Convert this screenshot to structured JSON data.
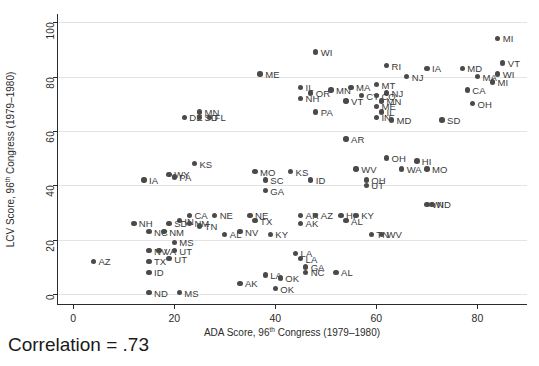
{
  "chart_data": {
    "type": "scatter",
    "title": "",
    "xlabel_parts": {
      "pre": "ADA Score, 96",
      "sup": "th",
      "post": " Congress (1979–1980)"
    },
    "ylabel_parts": {
      "pre": "LCV Score, 96",
      "sup": "th",
      "post": " Congress (1979–1980)"
    },
    "xlabel": "ADA Score, 96th Congress (1979–1980)",
    "ylabel": "LCV Score, 96th Congress (1979–1980)",
    "xlim": [
      -3,
      90
    ],
    "ylim": [
      -4,
      103
    ],
    "xticks": [
      0,
      20,
      40,
      60,
      80
    ],
    "yticks": [
      0,
      20,
      40,
      60,
      80,
      100
    ],
    "grid": "horizontal",
    "legend": "none",
    "annotation": "Correlation = .73",
    "point_color": "#4a4a4a",
    "points": [
      {
        "label": "MI",
        "x": 84.0,
        "y": 94.0,
        "lx": 5
      },
      {
        "label": "WI",
        "x": 48.0,
        "y": 89.0,
        "lx": 5
      },
      {
        "label": "VT",
        "x": 85.0,
        "y": 85.0,
        "lx": 5
      },
      {
        "label": "WI",
        "x": 84.0,
        "y": 81.0,
        "lx": 5
      },
      {
        "label": "RI",
        "x": 62.0,
        "y": 84.0,
        "lx": 5
      },
      {
        "label": "IA",
        "x": 70.0,
        "y": 83.0,
        "lx": 5
      },
      {
        "label": "MD",
        "x": 77.0,
        "y": 83.0,
        "lx": 5
      },
      {
        "label": "NJ",
        "x": 66.0,
        "y": 80.0,
        "lx": 5
      },
      {
        "label": "MA",
        "x": 80.0,
        "y": 80.0,
        "lx": 5
      },
      {
        "label": "MI",
        "x": 83.0,
        "y": 78.0,
        "lx": 5
      },
      {
        "label": "ME",
        "x": 37.0,
        "y": 81.0,
        "lx": 5
      },
      {
        "label": "MT",
        "x": 60.0,
        "y": 77.0,
        "lx": 5
      },
      {
        "label": "NJ",
        "x": 62.0,
        "y": 74.0,
        "lx": 5
      },
      {
        "label": "CA",
        "x": 78.0,
        "y": 75.0,
        "lx": 5
      },
      {
        "label": "IL",
        "x": 45.0,
        "y": 76.0,
        "lx": 5
      },
      {
        "label": "OR",
        "x": 47.0,
        "y": 74.0,
        "lx": 5
      },
      {
        "label": "MN",
        "x": 51.0,
        "y": 75.0,
        "lx": 5
      },
      {
        "label": "MA",
        "x": 55.0,
        "y": 76.0,
        "lx": 5
      },
      {
        "label": "CT",
        "x": 57.0,
        "y": 73.0,
        "lx": 5
      },
      {
        "label": "CO",
        "x": 60.0,
        "y": 73.0,
        "lx": 5
      },
      {
        "label": "NH",
        "x": 45.0,
        "y": 72.0,
        "lx": 5
      },
      {
        "label": "VT",
        "x": 54.0,
        "y": 71.0,
        "lx": 5
      },
      {
        "label": "MN",
        "x": 61.0,
        "y": 71.0,
        "lx": 5
      },
      {
        "label": "ME",
        "x": 60.0,
        "y": 69.0,
        "lx": 5
      },
      {
        "label": "OH",
        "x": 79.0,
        "y": 70.0,
        "lx": 5
      },
      {
        "label": "PA",
        "x": 48.0,
        "y": 67.0,
        "lx": 5
      },
      {
        "label": "IL",
        "x": 61.0,
        "y": 67.0,
        "lx": 5
      },
      {
        "label": "IN",
        "x": 60.0,
        "y": 65.0,
        "lx": 5
      },
      {
        "label": "MD",
        "x": 63.0,
        "y": 64.0,
        "lx": 5
      },
      {
        "label": "SD",
        "x": 73.0,
        "y": 64.0,
        "lx": 5
      },
      {
        "label": "DE",
        "x": 22.0,
        "y": 65.0,
        "lx": 5
      },
      {
        "label": "MN",
        "x": 25.0,
        "y": 67.0,
        "lx": 5
      },
      {
        "label": "SD",
        "x": 25.0,
        "y": 65.0,
        "lx": 5
      },
      {
        "label": "FL",
        "x": 27.0,
        "y": 65.0,
        "lx": 5
      },
      {
        "label": "AR",
        "x": 54.0,
        "y": 57.0,
        "lx": 5
      },
      {
        "label": "OH",
        "x": 62.0,
        "y": 50.0,
        "lx": 5
      },
      {
        "label": "HI",
        "x": 68.0,
        "y": 49.0,
        "lx": 5
      },
      {
        "label": "WA",
        "x": 65.0,
        "y": 46.0,
        "lx": 5
      },
      {
        "label": "MO",
        "x": 70.0,
        "y": 46.0,
        "lx": 5
      },
      {
        "label": "KS",
        "x": 24.0,
        "y": 48.0,
        "lx": 5
      },
      {
        "label": "WY",
        "x": 19.0,
        "y": 44.0,
        "lx": 5
      },
      {
        "label": "PA",
        "x": 20.0,
        "y": 43.0,
        "lx": 5
      },
      {
        "label": "IA",
        "x": 14.0,
        "y": 42.0,
        "lx": 5
      },
      {
        "label": "MO",
        "x": 36.0,
        "y": 45.0,
        "lx": 5
      },
      {
        "label": "KS",
        "x": 43.0,
        "y": 45.0,
        "lx": 5
      },
      {
        "label": "WV",
        "x": 56.0,
        "y": 46.0,
        "lx": 5
      },
      {
        "label": "SC",
        "x": 38.0,
        "y": 42.0,
        "lx": 5
      },
      {
        "label": "ID",
        "x": 47.0,
        "y": 42.0,
        "lx": 5
      },
      {
        "label": "OH",
        "x": 58.0,
        "y": 42.0,
        "lx": 5
      },
      {
        "label": "UT",
        "x": 58.0,
        "y": 40.0,
        "lx": 5
      },
      {
        "label": "GA",
        "x": 38.0,
        "y": 38.0,
        "lx": 5
      },
      {
        "label": "CA",
        "x": 23.0,
        "y": 29.0,
        "lx": 5
      },
      {
        "label": "NE",
        "x": 28.0,
        "y": 29.0,
        "lx": 5
      },
      {
        "label": "NE",
        "x": 35.0,
        "y": 29.0,
        "lx": 5
      },
      {
        "label": "TX",
        "x": 36.0,
        "y": 27.0,
        "lx": 5
      },
      {
        "label": "AR",
        "x": 45.0,
        "y": 29.0,
        "lx": 5
      },
      {
        "label": "AZ",
        "x": 48.0,
        "y": 29.0,
        "lx": 5
      },
      {
        "label": "HI",
        "x": 53.0,
        "y": 29.0,
        "lx": 5
      },
      {
        "label": "KY",
        "x": 56.0,
        "y": 29.0,
        "lx": 5
      },
      {
        "label": "AL",
        "x": 54.0,
        "y": 27.0,
        "lx": 5
      },
      {
        "label": "IN",
        "x": 21.0,
        "y": 27.0,
        "lx": 5
      },
      {
        "label": "NH",
        "x": 12.0,
        "y": 26.0,
        "lx": 5
      },
      {
        "label": "SD",
        "x": 19.0,
        "y": 26.0,
        "lx": 5
      },
      {
        "label": "NM",
        "x": 23.0,
        "y": 26.0,
        "lx": 5
      },
      {
        "label": "TN",
        "x": 25.0,
        "y": 25.0,
        "lx": 5
      },
      {
        "label": "NC",
        "x": 15.0,
        "y": 23.0,
        "lx": 5
      },
      {
        "label": "NM",
        "x": 18.0,
        "y": 23.0,
        "lx": 5
      },
      {
        "label": "NV",
        "x": 33.0,
        "y": 23.0,
        "lx": 5
      },
      {
        "label": "AK",
        "x": 45.0,
        "y": 26.0,
        "lx": 5
      },
      {
        "label": "TN",
        "x": 59.0,
        "y": 22.0,
        "lx": 5
      },
      {
        "label": "WV",
        "x": 61.0,
        "y": 22.0,
        "lx": 5
      },
      {
        "label": "WI",
        "x": 70.0,
        "y": 33.0,
        "lx": 5
      },
      {
        "label": "ND",
        "x": 71.0,
        "y": 33.0,
        "lx": 5
      },
      {
        "label": "KY",
        "x": 39.0,
        "y": 22.0,
        "lx": 5
      },
      {
        "label": "AL",
        "x": 30.0,
        "y": 22.0,
        "lx": 5
      },
      {
        "label": "MS",
        "x": 20.0,
        "y": 19.0,
        "lx": 5
      },
      {
        "label": "NV",
        "x": 15.0,
        "y": 16.0,
        "lx": 5
      },
      {
        "label": "VA",
        "x": 17.0,
        "y": 16.0,
        "lx": 5
      },
      {
        "label": "UT",
        "x": 20.0,
        "y": 16.0,
        "lx": 5
      },
      {
        "label": "UT",
        "x": 19.0,
        "y": 13.0,
        "lx": 5
      },
      {
        "label": "LA",
        "x": 44.0,
        "y": 15.0,
        "lx": 5
      },
      {
        "label": "LA",
        "x": 45.0,
        "y": 13.0,
        "lx": 5
      },
      {
        "label": "AZ",
        "x": 4.0,
        "y": 12.0,
        "lx": 5
      },
      {
        "label": "TX",
        "x": 15.0,
        "y": 12.0,
        "lx": 5
      },
      {
        "label": "GA",
        "x": 46.0,
        "y": 10.0,
        "lx": 5
      },
      {
        "label": "NC",
        "x": 46.0,
        "y": 8.0,
        "lx": 5
      },
      {
        "label": "AL",
        "x": 52.0,
        "y": 8.0,
        "lx": 5
      },
      {
        "label": "ID",
        "x": 15.0,
        "y": 8.0,
        "lx": 5
      },
      {
        "label": "LA",
        "x": 38.0,
        "y": 7.0,
        "lx": 5
      },
      {
        "label": "OK",
        "x": 41.0,
        "y": 6.0,
        "lx": 5
      },
      {
        "label": "AK",
        "x": 33.0,
        "y": 4.0,
        "lx": 5
      },
      {
        "label": "ND",
        "x": 15.0,
        "y": 0.5,
        "lx": 5
      },
      {
        "label": "MS",
        "x": 21.0,
        "y": 0.5,
        "lx": 5
      },
      {
        "label": "OK",
        "x": 40.0,
        "y": 2.0,
        "lx": 5
      }
    ]
  }
}
